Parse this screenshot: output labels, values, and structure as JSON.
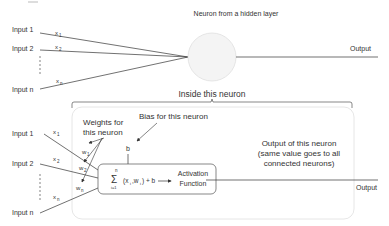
{
  "top": {
    "title": "Neuron from a hidden layer",
    "inputs": [
      "Input 1",
      "Input 2",
      "Input n"
    ],
    "signals": [
      "x",
      "x",
      "x"
    ],
    "signal_subs": [
      "1",
      "2",
      "n"
    ],
    "output": "Output"
  },
  "inside": {
    "title": "Inside this neuron",
    "inputs": [
      "Input 1",
      "Input 2",
      "Input n"
    ],
    "signals": [
      "x",
      "x",
      "x"
    ],
    "signal_subs": [
      "1",
      "2",
      "n"
    ],
    "weights": [
      "w",
      "w",
      "w"
    ],
    "weight_subs": [
      "1",
      "2",
      "n"
    ],
    "weights_label_1": "Weights for",
    "weights_label_2": "this neuron",
    "bias_label": "Bias for this neuron",
    "bias_symbol": "b",
    "sum_sigma": "Σ",
    "sum_top": "n",
    "sum_bottom": "i=1",
    "sum_expr": "(x",
    "sum_expr_sub_i": "i",
    "sum_expr_mid": ",w",
    "sum_expr_sub_i2": "i",
    "sum_expr_end": ") + b",
    "activation_1": "Activation",
    "activation_2": "Function",
    "output_desc_1": "Output of this neuron",
    "output_desc_2": "(same value goes to all",
    "output_desc_3": "connected neurons)",
    "output": "Output"
  },
  "colors": {
    "line": "#333333",
    "neuron_fill": "#f4f4f4",
    "neuron_stroke": "#dddddd",
    "box_stroke": "#cccccc",
    "inner_box_stroke": "#555555"
  }
}
